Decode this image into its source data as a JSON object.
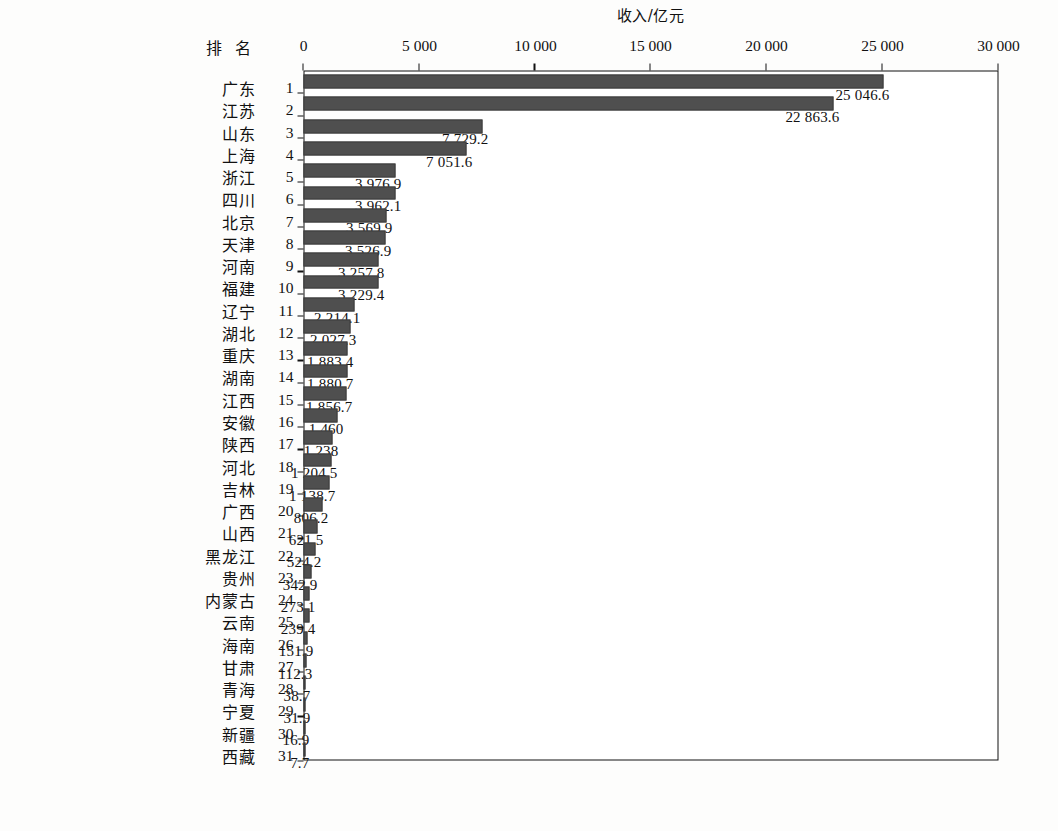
{
  "figure": {
    "row_header_label": "排 名",
    "value_axis_title": "收入/亿元",
    "bar_color": "#4f4f4f",
    "frame_color": "#111111"
  },
  "chart_data": {
    "type": "bar",
    "title": "",
    "xlabel": "排 名",
    "ylabel": "收入/亿元",
    "orientation": "vertical-rotated-90",
    "grid": false,
    "legend": "none",
    "ylim": [
      0,
      30000
    ],
    "yticks": [
      0,
      5000,
      10000,
      15000,
      20000,
      25000,
      30000
    ],
    "ytick_labels": [
      "0",
      "5 000",
      "10 000",
      "15 000",
      "20 000",
      "25 000",
      "30 000"
    ],
    "ranks": [
      1,
      2,
      3,
      4,
      5,
      6,
      7,
      8,
      9,
      10,
      11,
      12,
      13,
      14,
      15,
      16,
      17,
      18,
      19,
      20,
      21,
      22,
      23,
      24,
      25,
      26,
      27,
      28,
      29,
      30,
      31
    ],
    "categories": [
      "广东",
      "江苏",
      "山东",
      "上海",
      "浙江",
      "四川",
      "北京",
      "天津",
      "河南",
      "福建",
      "辽宁",
      "湖北",
      "重庆",
      "湖南",
      "江西",
      "安徽",
      "陕西",
      "河北",
      "吉林",
      "广西",
      "山西",
      "黑龙江",
      "贵州",
      "内蒙古",
      "云南",
      "海南",
      "甘肃",
      "青海",
      "宁夏",
      "新疆",
      "西藏"
    ],
    "values": [
      25046.6,
      22863.6,
      7729.2,
      7051.6,
      3976.9,
      3962.1,
      3569.9,
      3526.9,
      3257.8,
      3229.4,
      2214.1,
      2027.3,
      1883.4,
      1880.7,
      1856.7,
      1460,
      1238,
      1204.5,
      1138.7,
      806.2,
      621.5,
      524.2,
      342.9,
      273.1,
      239.4,
      151.9,
      112.3,
      38.7,
      31.9,
      16.9,
      7.7
    ],
    "value_labels": [
      "25 046.6",
      "22 863.6",
      "7 729.2",
      "7 051.6",
      "3 976.9",
      "3 962.1",
      "3 569.9",
      "3 526.9",
      "3 257.8",
      "3 229.4",
      "2 214.1",
      "2 027.3",
      "1 883.4",
      "1 880.7",
      "1 856.7",
      "1 460",
      "1 238",
      "1 204.5",
      "1 138.7",
      "806.2",
      "621.5",
      "524.2",
      "342.9",
      "273.1",
      "239.4",
      "151.9",
      "112.3",
      "38.7",
      "31.9",
      "16.9",
      "7.7"
    ]
  }
}
